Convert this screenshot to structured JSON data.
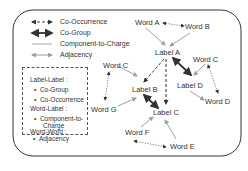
{
  "legend": {
    "items": [
      {
        "label": "Co-Occurrence",
        "style": "dashed-bidirectional"
      },
      {
        "label": "Co-Group",
        "style": "thick-bidirectional"
      },
      {
        "label": "Component-to-Charge",
        "style": "thin-gray-arrow"
      },
      {
        "label": "Adjacency",
        "style": "dotted-bidirectional"
      }
    ],
    "box": {
      "group1": "Label-Label :",
      "g1_items": [
        "Co-Group",
        "Co-Occurrence"
      ],
      "group2": "Word-Label :",
      "g2_items": [
        "Component-to-",
        "Charge"
      ],
      "group3": "Word-Word :",
      "g3_items": [
        "Adjacency"
      ]
    }
  },
  "nodes": {
    "word_a": "Word A",
    "word_b": "Word B",
    "label_a": "Label A",
    "word_c_right": "Word C",
    "word_c_left": "Word C",
    "label_d": "Label D",
    "label_b": "Label B",
    "word_d": "Word D",
    "word_g": "Word G",
    "label_c": "Label C",
    "word_f": "Word F",
    "word_e": "Word E"
  },
  "colors": {
    "edge_dark": "#333333",
    "edge_gray": "#a0a0a0",
    "frame": "#333333"
  }
}
